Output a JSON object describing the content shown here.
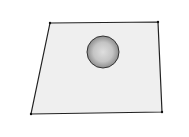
{
  "diagram": {
    "type": "3d-scene-sketch",
    "plane": {
      "corners": [
        [
          50,
          23
        ],
        [
          158,
          22
        ],
        [
          162,
          112
        ],
        [
          31,
          114
        ]
      ],
      "fill": "#efefef",
      "stroke": "#222222"
    },
    "sphere": {
      "cx": 103,
      "cy": 52,
      "r": 16,
      "highlight": "#dcdcdc",
      "shadow": "#8a8a8a",
      "stroke": "#333333"
    }
  }
}
